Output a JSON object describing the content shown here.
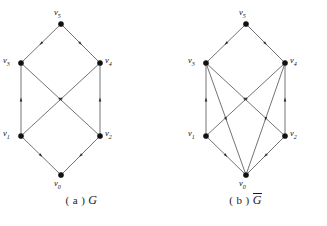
{
  "figure": {
    "panels": [
      {
        "id": "a",
        "caption_index": "( a )",
        "caption_name": "G",
        "caption_overline": false,
        "vertices": [
          {
            "id": "v5",
            "label": "v",
            "sub": "5",
            "x": 61,
            "y": 24,
            "label_x": 54,
            "label_y": 7
          },
          {
            "id": "v3",
            "label": "v",
            "sub": "3",
            "x": 21,
            "y": 63,
            "label_x": 3,
            "label_y": 55
          },
          {
            "id": "v4",
            "label": "v",
            "sub": "4",
            "x": 100,
            "y": 63,
            "label_x": 105,
            "label_y": 55
          },
          {
            "id": "v1",
            "label": "v",
            "sub": "1",
            "x": 21,
            "y": 136,
            "label_x": 3,
            "label_y": 128
          },
          {
            "id": "v2",
            "label": "v",
            "sub": "2",
            "x": 100,
            "y": 136,
            "label_x": 105,
            "label_y": 128
          },
          {
            "id": "v0",
            "label": "v",
            "sub": "0",
            "x": 61,
            "y": 175,
            "label_x": 54,
            "label_y": 178
          }
        ],
        "edges": [
          {
            "from": "v5",
            "to": "v3"
          },
          {
            "from": "v5",
            "to": "v4"
          },
          {
            "from": "v3",
            "to": "v2"
          },
          {
            "from": "v4",
            "to": "v1"
          },
          {
            "from": "v1",
            "to": "v3"
          },
          {
            "from": "v2",
            "to": "v4"
          },
          {
            "from": "v1",
            "to": "v0"
          },
          {
            "from": "v2",
            "to": "v0"
          }
        ]
      },
      {
        "id": "b",
        "caption_index": "( b )",
        "caption_name": "G",
        "caption_overline": true,
        "vertices": [
          {
            "id": "v5",
            "label": "v",
            "sub": "5",
            "x": 82,
            "y": 24,
            "label_x": 75,
            "label_y": 7
          },
          {
            "id": "v3",
            "label": "v",
            "sub": "3",
            "x": 42,
            "y": 63,
            "label_x": 24,
            "label_y": 55
          },
          {
            "id": "v4",
            "label": "v",
            "sub": "4",
            "x": 121,
            "y": 63,
            "label_x": 126,
            "label_y": 55
          },
          {
            "id": "v1",
            "label": "v",
            "sub": "1",
            "x": 42,
            "y": 136,
            "label_x": 24,
            "label_y": 128
          },
          {
            "id": "v2",
            "label": "v",
            "sub": "2",
            "x": 121,
            "y": 136,
            "label_x": 126,
            "label_y": 128
          },
          {
            "id": "v0",
            "label": "v",
            "sub": "0",
            "x": 82,
            "y": 175,
            "label_x": 75,
            "label_y": 178
          }
        ],
        "edges": [
          {
            "from": "v5",
            "to": "v3"
          },
          {
            "from": "v5",
            "to": "v4"
          },
          {
            "from": "v3",
            "to": "v2"
          },
          {
            "from": "v4",
            "to": "v1"
          },
          {
            "from": "v1",
            "to": "v3"
          },
          {
            "from": "v2",
            "to": "v4"
          },
          {
            "from": "v1",
            "to": "v0"
          },
          {
            "from": "v2",
            "to": "v0"
          },
          {
            "from": "v3",
            "to": "v0"
          },
          {
            "from": "v4",
            "to": "v0"
          }
        ]
      }
    ],
    "colors": {
      "edge": "#5a5a5a",
      "node": "#111111",
      "arrow": "#2a2a2a",
      "text": "#111111",
      "background": "#ffffff"
    },
    "style": {
      "node_radius": 2.6,
      "arrow_size": 3.6
    }
  }
}
